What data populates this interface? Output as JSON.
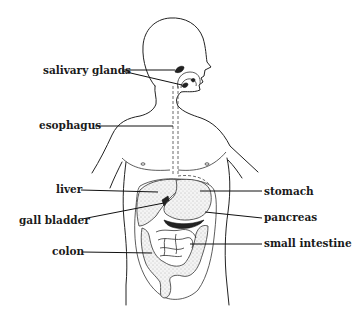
{
  "diagram": {
    "labels": {
      "salivary_glands": "salivary glands",
      "esophagus": "esophagus",
      "liver": "liver",
      "gall_bladder": "gall bladder",
      "colon": "colon",
      "stomach": "stomach",
      "pancreas": "pancreas",
      "small_intestine": "small intestine"
    },
    "label_side": {
      "left": [
        "salivary glands",
        "esophagus",
        "liver",
        "gall bladder",
        "colon"
      ],
      "right": [
        "stomach",
        "pancreas",
        "small intestine"
      ]
    },
    "colors": {
      "line": "#222222",
      "background": "#ffffff",
      "gland_fill": "#222222"
    }
  }
}
